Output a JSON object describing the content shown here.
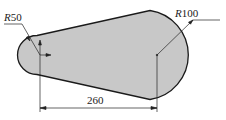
{
  "diagram": {
    "type": "cam-profile drawing",
    "labels": {
      "small_radius": {
        "prefix": "R",
        "value": "50"
      },
      "large_radius": {
        "prefix": "R",
        "value": "100"
      },
      "center_distance": "260"
    },
    "colors": {
      "fill": "#c8c8c8",
      "outline": "#1a1a1a",
      "dimension": "#333333"
    }
  }
}
